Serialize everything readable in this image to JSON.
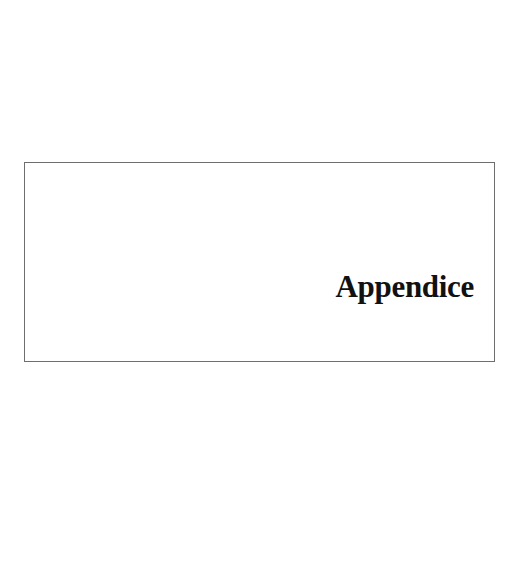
{
  "page": {
    "section_title": "Appendice"
  }
}
